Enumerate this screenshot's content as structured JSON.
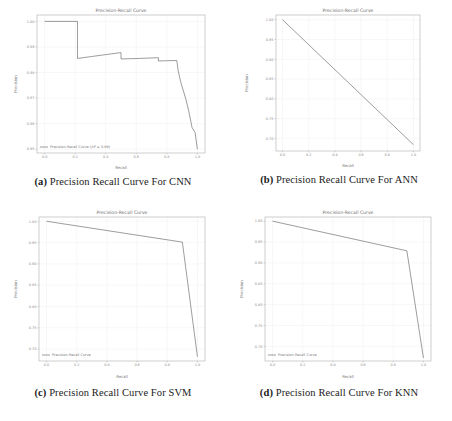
{
  "figure": {
    "panels": [
      {
        "key": "cnn",
        "caption_label": "(a)",
        "caption_text": "Precision Recall Curve For CNN",
        "chart_data": {
          "type": "line",
          "title": "Precision-Recall Curve",
          "xlabel": "Recall",
          "ylabel": "Precision",
          "xlim": [
            -0.05,
            1.05
          ],
          "ylim": [
            0.9485,
            1.0025
          ],
          "xticks": [
            "0.0",
            "0.2",
            "0.4",
            "0.6",
            "0.8",
            "1.0"
          ],
          "xtick_values": [
            0.0,
            0.2,
            0.4,
            0.6,
            0.8,
            1.0
          ],
          "yticks": [
            "0.95",
            "0.96",
            "0.97",
            "0.98",
            "0.99",
            "1.00"
          ],
          "ytick_values": [
            0.95,
            0.96,
            0.97,
            0.98,
            0.99,
            1.0
          ],
          "grid": true,
          "legend_position": "lower left",
          "series": [
            {
              "name": "Precision-Recall Curve (AP = 0.99)",
              "x": [
                0.0,
                0.215,
                0.215,
                0.3,
                0.4,
                0.5,
                0.5,
                0.62,
                0.745,
                0.745,
                0.8,
                0.865,
                0.875,
                0.89,
                0.905,
                0.925,
                0.945,
                0.965,
                0.985,
                1.0
              ],
              "y": [
                1.0,
                1.0,
                0.9855,
                0.9862,
                0.987,
                0.9878,
                0.9853,
                0.9855,
                0.9858,
                0.9845,
                0.9846,
                0.9847,
                0.9805,
                0.9765,
                0.9735,
                0.9695,
                0.9645,
                0.9585,
                0.9565,
                0.95
              ]
            }
          ]
        }
      },
      {
        "key": "ann",
        "caption_label": "(b)",
        "caption_text": "Precision Recall Curve For ANN",
        "chart_data": {
          "type": "line",
          "title": "Precision-Recall Curve",
          "xlabel": "Recall",
          "ylabel": "Precision",
          "xlim": [
            -0.05,
            1.05
          ],
          "ylim": [
            0.668,
            1.012
          ],
          "xticks": [
            "0.0",
            "0.2",
            "0.4",
            "0.6",
            "0.8",
            "1.0"
          ],
          "xtick_values": [
            0.0,
            0.2,
            0.4,
            0.6,
            0.8,
            1.0
          ],
          "yticks": [
            "0.70",
            "0.75",
            "0.80",
            "0.85",
            "0.90",
            "0.95",
            "1.00"
          ],
          "ytick_values": [
            0.7,
            0.75,
            0.8,
            0.85,
            0.9,
            0.95,
            1.0
          ],
          "grid": true,
          "legend_position": "none",
          "series": [
            {
              "name": "Precision-Recall Curve",
              "x": [
                0.0,
                1.0
              ],
              "y": [
                1.0,
                0.684
              ]
            }
          ]
        }
      },
      {
        "key": "svm",
        "caption_label": "(c)",
        "caption_text": "Precision Recall Curve For SVM",
        "chart_data": {
          "type": "line",
          "title": "Precision-Recall Curve",
          "xlabel": "Recall",
          "ylabel": "Precision",
          "xlim": [
            -0.05,
            1.05
          ],
          "ylim": [
            0.672,
            1.01
          ],
          "xticks": [
            "0.0",
            "0.2",
            "0.4",
            "0.6",
            "0.8",
            "1.0"
          ],
          "xtick_values": [
            0.0,
            0.2,
            0.4,
            0.6,
            0.8,
            1.0
          ],
          "yticks": [
            "0.70",
            "0.75",
            "0.80",
            "0.85",
            "0.90",
            "0.95",
            "1.00"
          ],
          "ytick_values": [
            0.7,
            0.75,
            0.8,
            0.85,
            0.9,
            0.95,
            1.0
          ],
          "grid": true,
          "legend_position": "lower left",
          "series": [
            {
              "name": "Precision-Recall Curve",
              "x": [
                0.0,
                0.9,
                1.0
              ],
              "y": [
                1.0,
                0.951,
                0.682
              ]
            }
          ]
        }
      },
      {
        "key": "knn",
        "caption_label": "(d)",
        "caption_text": "Precision Recall Curve For KNN",
        "chart_data": {
          "type": "line",
          "title": "Precision-Recall Curve",
          "xlabel": "Recall",
          "ylabel": "Precision",
          "xlim": [
            -0.05,
            1.05
          ],
          "ylim": [
            0.665,
            1.01
          ],
          "xticks": [
            "0.0",
            "0.2",
            "0.4",
            "0.6",
            "0.8",
            "1.0"
          ],
          "xtick_values": [
            0.0,
            0.2,
            0.4,
            0.6,
            0.8,
            1.0
          ],
          "yticks": [
            "0.70",
            "0.75",
            "0.80",
            "0.85",
            "0.90",
            "0.95",
            "1.00"
          ],
          "ytick_values": [
            0.7,
            0.75,
            0.8,
            0.85,
            0.9,
            0.95,
            1.0
          ],
          "grid": true,
          "legend_position": "lower left",
          "series": [
            {
              "name": "Precision-Recall Curve",
              "x": [
                0.0,
                0.89,
                1.0
              ],
              "y": [
                1.0,
                0.929,
                0.672
              ]
            }
          ]
        }
      }
    ]
  },
  "style": {
    "curve_color": "#4c4c4c",
    "grid_color": "#f2f2f2",
    "axis_color": "#b9b9b9",
    "tick_label_color": "#8a8a8a",
    "title_color": "#6e6e6e",
    "background": "#ffffff"
  }
}
